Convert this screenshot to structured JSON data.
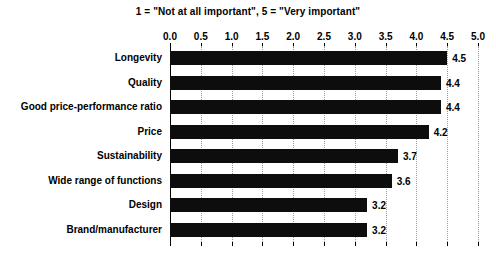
{
  "chart_data": {
    "type": "bar",
    "orientation": "horizontal",
    "title": "1 = \"Not at all important\", 5 = \"Very important\"",
    "xlabel": "",
    "ylabel": "",
    "xlim": [
      0.0,
      5.0
    ],
    "grid": true,
    "legend": null,
    "axis_position": "top",
    "categories": [
      "Longevity",
      "Quality",
      "Good price-performance ratio",
      "Price",
      "Sustainability",
      "Wide range of functions",
      "Design",
      "Brand/manufacturer"
    ],
    "values": [
      4.5,
      4.4,
      4.4,
      4.2,
      3.7,
      3.6,
      3.2,
      3.2
    ],
    "value_labels": [
      "4.5",
      "4.4",
      "4.4",
      "4.2",
      "3.7",
      "3.6",
      "3.2",
      "3.2"
    ],
    "xticks": [
      0.0,
      0.5,
      1.0,
      1.5,
      2.0,
      2.5,
      3.0,
      3.5,
      4.0,
      4.5,
      5.0
    ],
    "xtick_labels": [
      "0.0",
      "0.5",
      "1.0",
      "1.5",
      "2.0",
      "2.5",
      "3.0",
      "3.5",
      "4.0",
      "4.5",
      "5.0"
    ],
    "bar_color": "#0d0d0d",
    "background_color": "#ffffff",
    "gridline_color": "#9a9a9a",
    "text_color": "#000000"
  }
}
